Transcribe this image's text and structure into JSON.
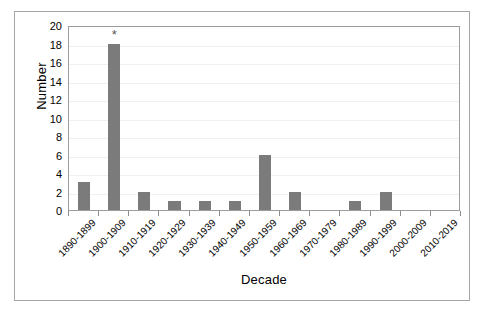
{
  "chart_data": {
    "type": "bar",
    "title": "",
    "subtitle": "",
    "xlabel": "Decade",
    "ylabel": "Number",
    "categories": [
      "1890-1899",
      "1900-1909",
      "1910-1919",
      "1920-1929",
      "1930-1939",
      "1940-1949",
      "1950-1959",
      "1960-1969",
      "1970-1979",
      "1980-1989",
      "1990-1999",
      "2000-2009",
      "2010-2019"
    ],
    "values": [
      3,
      18,
      2,
      1,
      1,
      1,
      6,
      2,
      0,
      1,
      2,
      0,
      0
    ],
    "ylim": [
      0,
      20
    ],
    "ytick_labels": [
      "0",
      "2",
      "4",
      "6",
      "8",
      "10",
      "12",
      "14",
      "16",
      "18",
      "20"
    ],
    "ytick_values": [
      0,
      2,
      4,
      6,
      8,
      10,
      12,
      14,
      16,
      18,
      20
    ],
    "grid": "horizontal",
    "legend": "none",
    "bar_color": "#7b7b7b",
    "gridline_color": "#f0f0f0",
    "axis_color": "#9c9c9c",
    "annotations": [
      {
        "category": "1900-1909",
        "index": 1,
        "text": "*"
      }
    ]
  }
}
